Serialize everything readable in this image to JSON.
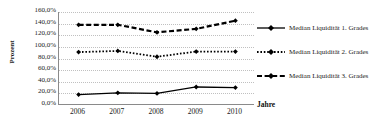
{
  "chart_data": {
    "type": "line",
    "title": "",
    "xlabel": "Jahre",
    "ylabel": "Prozent",
    "categories": [
      "2006",
      "2007",
      "2008",
      "2009",
      "2010"
    ],
    "ylim": [
      0,
      160
    ],
    "ytick_labels": [
      "0,0%",
      "20,0%",
      "40,0%",
      "60,0%",
      "80,0%",
      "100,0%",
      "120,0%",
      "140,0%",
      "160,0%"
    ],
    "ytick_values": [
      0,
      20,
      40,
      60,
      80,
      100,
      120,
      140,
      160
    ],
    "grid": true,
    "legend_position": "right",
    "series": [
      {
        "name": "Median Liquidität 1. Grades",
        "values": [
          18,
          21,
          20,
          31,
          30
        ],
        "line_style": "solid",
        "marker": "diamond",
        "color": "#000000"
      },
      {
        "name": "Median Liquidität 2. Grades",
        "values": [
          91,
          93,
          83,
          92,
          92
        ],
        "line_style": "dotted",
        "marker": "diamond",
        "color": "#000000"
      },
      {
        "name": "Median Liquidität 3. Grades",
        "values": [
          138,
          138,
          125,
          131,
          145
        ],
        "line_style": "dashed",
        "marker": "diamond",
        "color": "#000000"
      }
    ]
  },
  "axis": {
    "y_title": "Prozent",
    "x_title": "Jahre"
  },
  "legend": {
    "items": [
      {
        "label": "Median Liquidität 1. Grades"
      },
      {
        "label": "Median Liquidität 2. Grades"
      },
      {
        "label": "Median Liquidität 3. Grades"
      }
    ]
  },
  "colors": {
    "line": "#000000",
    "grid": "#c0c0c0",
    "axis": "#8a8a8a",
    "text": "#1a1a1a",
    "background": "#ffffff"
  }
}
